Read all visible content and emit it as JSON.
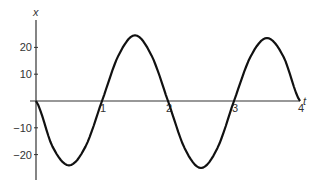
{
  "chart_data": {
    "type": "line",
    "title": "",
    "xlabel": "t",
    "ylabel": "x",
    "xlim": [
      0,
      4
    ],
    "ylim": [
      -27,
      27
    ],
    "grid": false,
    "legend": null,
    "x_ticks": [
      1,
      2,
      3,
      4
    ],
    "x_tick_labels": [
      "1",
      "2",
      "3",
      "4"
    ],
    "y_ticks": [
      20,
      10,
      -10,
      -20
    ],
    "y_tick_labels": [
      "20",
      "10",
      "−10",
      "−20"
    ],
    "series": [
      {
        "name": "x(t)",
        "x": [
          0,
          0.25,
          0.5,
          0.75,
          1,
          1.25,
          1.5,
          1.75,
          2,
          2.25,
          2.5,
          2.75,
          3,
          3.25,
          3.5,
          3.75,
          4
        ],
        "values": [
          0,
          -17,
          -24,
          -17,
          0,
          17,
          24.5,
          17,
          0,
          -17.5,
          -25,
          -17.5,
          0,
          16.5,
          23.5,
          16.5,
          0
        ]
      }
    ],
    "color": "#111111"
  }
}
